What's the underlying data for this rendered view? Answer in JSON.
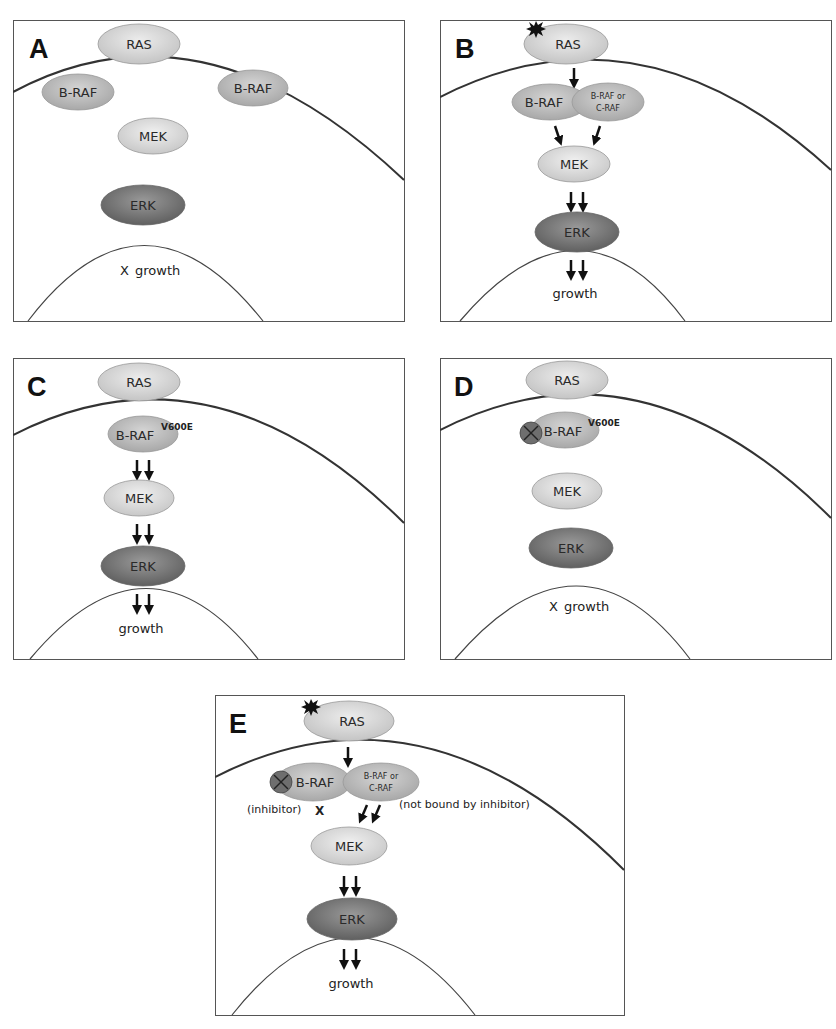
{
  "figure": {
    "panels": [
      {
        "id": "A",
        "letter": "A",
        "ras": "RAS",
        "braf_left": "B-RAF",
        "braf_right": "B-RAF",
        "mek": "MEK",
        "erk": "ERK",
        "outcome_mark": "X",
        "outcome": "growth"
      },
      {
        "id": "B",
        "letter": "B",
        "ras": "RAS",
        "braf": "B-RAF",
        "partner_line1": "B-RAF or",
        "partner_line2": "C-RAF",
        "mek": "MEK",
        "erk": "ERK",
        "outcome": "growth"
      },
      {
        "id": "C",
        "letter": "C",
        "ras": "RAS",
        "braf": "B-RAF",
        "mutation": "V600E",
        "mek": "MEK",
        "erk": "ERK",
        "outcome": "growth"
      },
      {
        "id": "D",
        "letter": "D",
        "ras": "RAS",
        "braf": "B-RAF",
        "mutation": "V600E",
        "mek": "MEK",
        "erk": "ERK",
        "outcome_mark": "X",
        "outcome": "growth"
      },
      {
        "id": "E",
        "letter": "E",
        "ras": "RAS",
        "braf": "B-RAF",
        "partner_line1": "B-RAF or",
        "partner_line2": "C-RAF",
        "inhibitor_label": "(inhibitor)",
        "block_mark": "X",
        "not_bound_label": "(not bound by inhibitor)",
        "mek": "MEK",
        "erk": "ERK",
        "outcome": "growth"
      }
    ],
    "colors": {
      "ras": "#d6d6d6",
      "braf": "#bdbdbd",
      "mek": "#dcdcdc",
      "erk": "#7d7d7d",
      "inhibitor": "#6e6e6e",
      "membrane": "#2a2a2a",
      "nucleus": "#444444"
    }
  }
}
